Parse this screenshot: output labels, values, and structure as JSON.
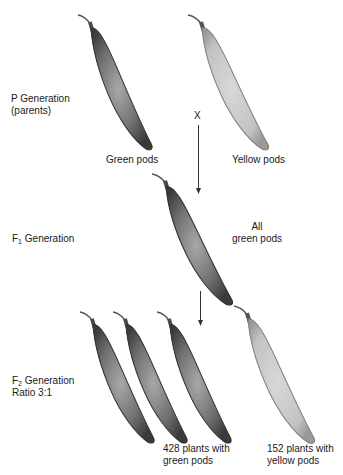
{
  "colors": {
    "green_pod_dark": "#3c3c3c",
    "green_pod_mid": "#8a8a8a",
    "yellow_pod_mid": "#c8c8c8",
    "yellow_pod_edge": "#8c8c8c",
    "text": "#1a1a1a"
  },
  "generations": {
    "p": {
      "label": "P Generation",
      "sublabel": "(parents)",
      "cross_symbol": "X",
      "pods": [
        {
          "caption": "Green pods",
          "color": "green"
        },
        {
          "caption": "Yellow pods",
          "color": "yellow"
        }
      ]
    },
    "f1": {
      "label_prefix": "F",
      "label_sub": "1",
      "label_suffix": " Generation",
      "caption_line1": "All",
      "caption_line2": "green pods"
    },
    "f2": {
      "label_prefix": "F",
      "label_sub": "2",
      "label_suffix": " Generation",
      "ratio": "Ratio 3:1",
      "green": {
        "line1": "428 plants with",
        "line2": "green pods",
        "count": 428
      },
      "yellow": {
        "line1": "152 plants with",
        "line2": "yellow pods",
        "count": 152
      }
    }
  }
}
